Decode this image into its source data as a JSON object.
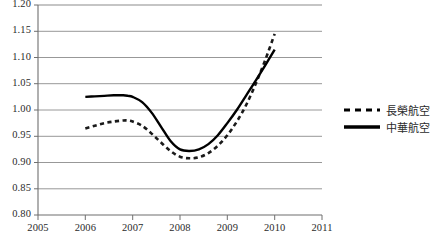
{
  "chart_data": {
    "type": "line",
    "title": "",
    "xlabel": "",
    "ylabel": "",
    "xlim": [
      2005,
      2011
    ],
    "ylim": [
      0.8,
      1.2
    ],
    "grid": true,
    "legend_position": "right",
    "xticks": [
      "2005",
      "2006",
      "2007",
      "2008",
      "2009",
      "2010",
      "2011"
    ],
    "xtick_values": [
      2005,
      2006,
      2007,
      2008,
      2009,
      2010,
      2011
    ],
    "yticks": [
      "0.80",
      "0.85",
      "0.90",
      "0.95",
      "1.00",
      "1.05",
      "1.10",
      "1.15",
      "1.20"
    ],
    "ytick_values": [
      0.8,
      0.85,
      0.9,
      0.95,
      1.0,
      1.05,
      1.1,
      1.15,
      1.2
    ],
    "series": [
      {
        "name": "長榮航空",
        "style": "dashed",
        "color": "#1a1a1a",
        "x": [
          2006.0,
          2006.2,
          2006.4,
          2006.6,
          2006.8,
          2006.9,
          2007.0,
          2007.2,
          2007.4,
          2007.6,
          2007.8,
          2008.0,
          2008.2,
          2008.4,
          2008.6,
          2008.8,
          2009.0,
          2009.2,
          2009.4,
          2009.6,
          2009.8,
          2010.0
        ],
        "values": [
          0.965,
          0.97,
          0.975,
          0.978,
          0.98,
          0.98,
          0.978,
          0.97,
          0.955,
          0.938,
          0.922,
          0.911,
          0.908,
          0.91,
          0.918,
          0.932,
          0.952,
          0.978,
          1.01,
          1.05,
          1.095,
          1.145
        ]
      },
      {
        "name": "中華航空",
        "style": "solid",
        "color": "#000000",
        "x": [
          2006.0,
          2006.2,
          2006.4,
          2006.6,
          2006.8,
          2006.9,
          2007.0,
          2007.2,
          2007.4,
          2007.6,
          2007.8,
          2008.0,
          2008.2,
          2008.4,
          2008.6,
          2008.8,
          2009.0,
          2009.2,
          2009.4,
          2009.6,
          2009.8,
          2010.0
        ],
        "values": [
          1.025,
          1.026,
          1.027,
          1.028,
          1.028,
          1.027,
          1.025,
          1.015,
          0.995,
          0.968,
          0.941,
          0.925,
          0.922,
          0.925,
          0.935,
          0.952,
          0.975,
          1.0,
          1.028,
          1.056,
          1.085,
          1.115
        ]
      }
    ]
  },
  "axis": {
    "y_tick_labels": [
      "1.20",
      "1.15",
      "1.10",
      "1.05",
      "1.00",
      "0.95",
      "0.90",
      "0.85",
      "0.80"
    ],
    "x_tick_labels": [
      "2005",
      "2006",
      "2007",
      "2008",
      "2009",
      "2010",
      "2011"
    ]
  },
  "legend": {
    "items": [
      {
        "label": "長榮航空",
        "style": "dashed"
      },
      {
        "label": "中華航空",
        "style": "solid"
      }
    ]
  },
  "colors": {
    "grid": "#8c8c8c",
    "axis": "#6f6f6f",
    "series_solid": "#000000",
    "series_dashed": "#1a1a1a",
    "background": "#ffffff",
    "text": "#2b2b2b"
  }
}
